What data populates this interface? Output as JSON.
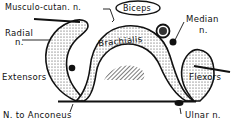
{
  "diagram": {
    "labels": {
      "musculo_cutan": "Musculo-cutan. n.",
      "biceps": "Biceps",
      "radial_line1": "Radial",
      "radial_line2": "n.",
      "median_line1": "Median",
      "median_line2": "n.",
      "brachialis": "Brachialis",
      "extensors": "Extensors",
      "flexors": "Flexors",
      "n_to_anconeus": "N. to Anconeus",
      "ulnar": "Ulnar n."
    }
  }
}
